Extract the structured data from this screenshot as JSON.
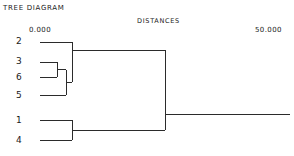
{
  "header": {
    "title": "TREE DIAGRAM",
    "axis_title": "DISTANCES",
    "axis_min_label": "0.000",
    "axis_max_label": "50.000"
  },
  "colors": {
    "background": "#ffffff",
    "line": "#2b2b2b",
    "text": "#1a1a1a"
  },
  "chart_data": {
    "type": "line",
    "chart_kind": "dendrogram",
    "title": "TREE DIAGRAM",
    "xlabel": "DISTANCES",
    "ylabel": "",
    "xlim": [
      0.0,
      50.0
    ],
    "grid": false,
    "legend": null,
    "orientation": "horizontal-left-to-right",
    "xtick_labels": [
      "0.000",
      "50.000"
    ],
    "xticks": [
      0.0,
      50.0
    ],
    "leaf_order": [
      "2",
      "3",
      "6",
      "5",
      "1",
      "4"
    ],
    "leaves": [
      {
        "label": "2",
        "y": 42
      },
      {
        "label": "3",
        "y": 62
      },
      {
        "label": "6",
        "y": 77
      },
      {
        "label": "5",
        "y": 95
      },
      {
        "label": "1",
        "y": 120
      },
      {
        "label": "4",
        "y": 140
      }
    ],
    "merges": [
      {
        "id": "A",
        "members": [
          "3",
          "6"
        ],
        "distance": 3.4,
        "x": 57,
        "y": 69.5,
        "y_top": 62,
        "y_bottom": 77
      },
      {
        "id": "B",
        "members": [
          "3",
          "6",
          "5"
        ],
        "distance": 5.2,
        "x": 66,
        "y": 82.2,
        "y_top": 69.5,
        "y_bottom": 95
      },
      {
        "id": "C",
        "members": [
          "2",
          "3",
          "6",
          "5"
        ],
        "distance": 6.4,
        "x": 72,
        "y": 50.0,
        "y_top": 42,
        "y_bottom": 82.2
      },
      {
        "id": "D",
        "members": [
          "1",
          "4"
        ],
        "distance": 6.4,
        "x": 72,
        "y": 130.0,
        "y_top": 120,
        "y_bottom": 140
      },
      {
        "id": "E",
        "members": [
          "2",
          "3",
          "6",
          "5",
          "1",
          "4"
        ],
        "distance": 24.8,
        "x": 165,
        "y": 114.0,
        "y_top": 50.0,
        "y_bottom": 130.0
      }
    ],
    "leaf_start_x": 40,
    "root_end_x": 290,
    "root_y": 114
  }
}
